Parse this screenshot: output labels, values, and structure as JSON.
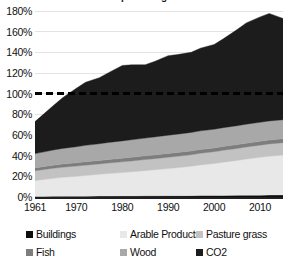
{
  "chart_data": {
    "type": "area",
    "stacked": true,
    "title": "Resource use as a percentage of 1961 baseline",
    "xlabel": "",
    "ylabel": "",
    "ylim": [
      0,
      180
    ],
    "ytick_labels": [
      "180%",
      "160%",
      "140%",
      "120%",
      "100%",
      "80%",
      "60%",
      "40%",
      "20%",
      "0%"
    ],
    "ytick_values": [
      180,
      160,
      140,
      120,
      100,
      80,
      60,
      40,
      20,
      0
    ],
    "xtick_labels": [
      "1961",
      "1970",
      "1980",
      "1990",
      "2000",
      "2010"
    ],
    "xtick_values": [
      1961,
      1970,
      1980,
      1990,
      2000,
      2010
    ],
    "xlim": [
      1961,
      2015
    ],
    "grid": true,
    "legend_position": "bottom",
    "x": [
      1961,
      1963,
      1965,
      1967,
      1970,
      1972,
      1975,
      1977,
      1980,
      1982,
      1985,
      1987,
      1990,
      1992,
      1995,
      1997,
      2000,
      2002,
      2005,
      2007,
      2010,
      2012,
      2015
    ],
    "series": [
      {
        "name": "Buildings",
        "color": "#0d0d0d",
        "values": [
          0.6,
          0.6,
          0.7,
          0.7,
          0.8,
          0.8,
          0.9,
          0.9,
          1.0,
          1.0,
          1.1,
          1.1,
          1.2,
          1.2,
          1.3,
          1.4,
          1.4,
          1.5,
          1.6,
          1.7,
          1.8,
          1.9,
          2.0
        ]
      },
      {
        "name": "Arable Products",
        "color": "#e8e8e8",
        "values": [
          15.4,
          16.4,
          17.4,
          18.3,
          19.2,
          20.0,
          21.0,
          21.8,
          22.6,
          23.4,
          24.4,
          25.2,
          26.3,
          27.1,
          28.4,
          29.6,
          31.0,
          32.2,
          33.8,
          35.0,
          36.6,
          37.6,
          38.6
        ]
      },
      {
        "name": "Pasture grass",
        "color": "#c2c2c2",
        "values": [
          9.5,
          9.6,
          9.7,
          9.8,
          9.9,
          10.0,
          10.1,
          10.2,
          10.4,
          10.5,
          10.7,
          10.8,
          11.0,
          11.1,
          11.2,
          11.3,
          11.4,
          11.5,
          11.6,
          11.7,
          11.8,
          11.9,
          12.0
        ]
      },
      {
        "name": "Fish",
        "color": "#7d7d7d",
        "values": [
          2.6,
          2.8,
          3.0,
          3.1,
          3.2,
          3.3,
          3.3,
          3.4,
          3.5,
          3.5,
          3.6,
          3.6,
          3.7,
          3.7,
          3.7,
          3.7,
          3.7,
          3.7,
          3.7,
          3.7,
          3.7,
          3.7,
          3.7
        ]
      },
      {
        "name": "Wood",
        "color": "#a8a8a8",
        "values": [
          13.9,
          14.3,
          14.7,
          15.1,
          15.6,
          15.9,
          16.2,
          16.5,
          16.8,
          17.0,
          17.2,
          17.4,
          17.6,
          17.7,
          17.9,
          18.0,
          18.1,
          18.2,
          18.3,
          18.4,
          18.4,
          18.5,
          18.5
        ]
      },
      {
        "name": "CO2",
        "color": "#1c1c1c",
        "values": [
          31.0,
          37.0,
          43.0,
          49.0,
          56.5,
          61.0,
          64.0,
          67.5,
          73.0,
          72.5,
          71.0,
          73.0,
          77.0,
          77.0,
          77.5,
          80.0,
          82.0,
          86.0,
          93.0,
          98.0,
          102.0,
          104.0,
          98.0
        ]
      }
    ],
    "reference_line": {
      "name": "100% baseline",
      "value": 100,
      "style": "dashed",
      "color": "#000000"
    },
    "totals": [
      73.0,
      80.7,
      88.5,
      96.0,
      105.2,
      111.0,
      115.5,
      120.3,
      127.3,
      127.9,
      128.0,
      131.1,
      136.8,
      137.8,
      140.0,
      144.0,
      147.6,
      153.1,
      162.0,
      168.5,
      174.3,
      177.6,
      172.8
    ]
  },
  "legend": {
    "items": [
      {
        "label": "Buildings",
        "color": "#0d0d0d"
      },
      {
        "label": "Arable Products",
        "color": "#e8e8e8"
      },
      {
        "label": "Pasture grass",
        "color": "#c2c2c2"
      },
      {
        "label": "Fish",
        "color": "#7d7d7d"
      },
      {
        "label": "Wood",
        "color": "#a8a8a8"
      },
      {
        "label": "CO2",
        "color": "#1c1c1c"
      }
    ]
  }
}
